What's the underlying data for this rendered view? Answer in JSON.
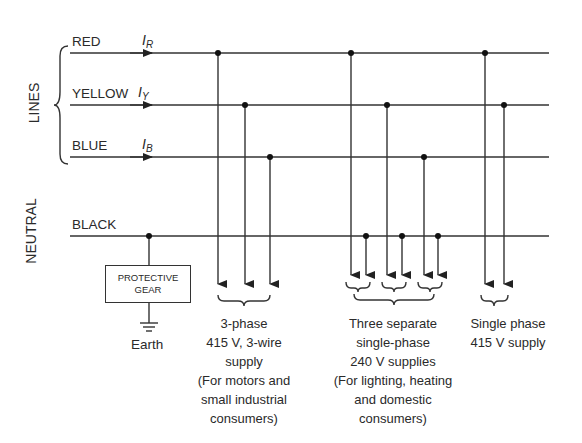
{
  "diagram": {
    "groups": {
      "lines_label": "LINES",
      "neutral_label": "NEUTRAL"
    },
    "conductors": [
      {
        "id": "red",
        "label": "RED",
        "current_symbol": "I",
        "current_sub": "R",
        "y": 53
      },
      {
        "id": "yellow",
        "label": "YELLOW",
        "current_symbol": "I",
        "current_sub": "Y",
        "y": 105
      },
      {
        "id": "blue",
        "label": "BLUE",
        "current_symbol": "I",
        "current_sub": "B",
        "y": 157
      },
      {
        "id": "neutral",
        "label": "BLACK",
        "y": 236
      }
    ],
    "protective_gear": {
      "line1": "PROTECTIVE",
      "line2": "GEAR",
      "earth_label": "Earth"
    },
    "supplies": [
      {
        "id": "three-phase",
        "lines": [
          "3-phase",
          "415 V, 3-wire",
          "supply",
          "(For motors and",
          "small industrial",
          "consumers)"
        ]
      },
      {
        "id": "single-phase-240",
        "lines": [
          "Three separate",
          "single-phase",
          "240 V supplies",
          "(For lighting, heating",
          "and domestic",
          "consumers)"
        ]
      },
      {
        "id": "single-phase-415",
        "lines": [
          "Single phase",
          "415 V supply"
        ]
      }
    ],
    "colors": {
      "line": "#333333",
      "text": "#2a2a2a",
      "background": "#ffffff"
    }
  }
}
